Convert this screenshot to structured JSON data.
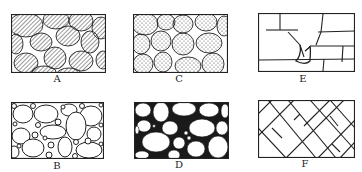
{
  "figure": {
    "panels": [
      {
        "id": "A",
        "label": "A",
        "description": "Rounded grains with hatched fill, sparse pore spaces"
      },
      {
        "id": "B",
        "label": "B",
        "description": "Large white rounded grains with small grains filling pores"
      },
      {
        "id": "C",
        "label": "C",
        "description": "Rounded grains with stippled fill, sparse pore spaces"
      },
      {
        "id": "D",
        "label": "D",
        "description": "White rounded grains separated by dark cement"
      },
      {
        "id": "E",
        "label": "E",
        "description": "Block rock with horizontal and vertical fractures, solution-widened crack"
      },
      {
        "id": "F",
        "label": "F",
        "description": "Rock with intersecting diagonal fracture sets"
      }
    ]
  },
  "colors": {
    "ink": "#222222",
    "paper": "#ffffff",
    "hatch": "#555555"
  }
}
